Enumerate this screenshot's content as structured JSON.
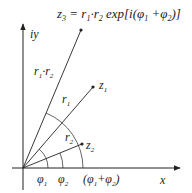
{
  "diagram": {
    "title_formula": {
      "lhs": "z",
      "lhs_sub": "3",
      "eq": " = r",
      "r1_sub": "1",
      "dot": "·",
      "r2": "r",
      "r2_sub": "2",
      "rest": " exp[i(φ",
      "phi1_sub": "1",
      "plus": " +φ",
      "phi2_sub": "2",
      "close": ")]"
    },
    "axes": {
      "y_label": "iy",
      "x_label": "x"
    },
    "points": [
      {
        "name": "z3",
        "label": "",
        "x": 81,
        "y": 30
      },
      {
        "name": "z1",
        "label": "z",
        "sub": "1",
        "x": 93,
        "y": 87
      },
      {
        "name": "z2",
        "label": "z",
        "sub": "2",
        "x": 82,
        "y": 144
      }
    ],
    "segment_labels": {
      "r1r2": {
        "a": "r",
        "a_sub": "1",
        "dot": "·",
        "b": "r",
        "b_sub": "2"
      },
      "r1": {
        "t": "r",
        "sub": "1"
      },
      "r2": {
        "t": "r",
        "sub": "2"
      }
    },
    "angle_labels": {
      "phi1": {
        "t": "φ",
        "sub": "1"
      },
      "phi2": {
        "t": "φ",
        "sub": "2"
      },
      "sum": {
        "open": "(φ",
        "sub1": "1",
        "plus": "+φ",
        "sub2": "2",
        "close": ")"
      }
    },
    "colors": {
      "stroke": "#222222",
      "background": "#ffffff"
    }
  }
}
